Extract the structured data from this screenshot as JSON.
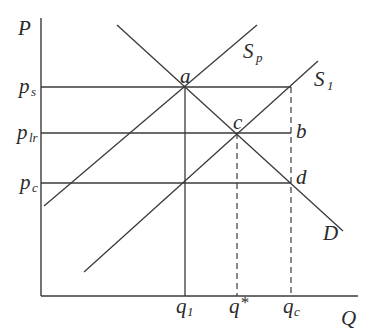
{
  "diagram": {
    "type": "supply-demand",
    "axes": {
      "y_label": "P",
      "x_label": "Q"
    },
    "price_levels": [
      {
        "id": "ps",
        "base": "p",
        "sub": "s",
        "y": 87
      },
      {
        "id": "plr",
        "base": "p",
        "sub": "lr",
        "y": 133
      },
      {
        "id": "pc",
        "base": "p",
        "sub": "c",
        "y": 183
      }
    ],
    "quantity_levels": [
      {
        "id": "q1",
        "base": "q",
        "sub": "1",
        "x": 185,
        "style": "solid"
      },
      {
        "id": "qstar",
        "base": "q",
        "sup": "*",
        "x": 237,
        "style": "dashed"
      },
      {
        "id": "qc",
        "base": "q",
        "sub": "c",
        "x": 291,
        "style": "dashed"
      }
    ],
    "curves": [
      {
        "id": "D",
        "label": "D",
        "from": [
          117,
          25
        ],
        "to": [
          343,
          231
        ]
      },
      {
        "id": "Sp",
        "label": "S",
        "sub": "p",
        "from": [
          44,
          206
        ],
        "to": [
          257,
          25
        ]
      },
      {
        "id": "S1",
        "label": "S",
        "sub": "1",
        "from": [
          84,
          272
        ],
        "to": [
          318,
          61
        ]
      }
    ],
    "points": [
      {
        "id": "a",
        "label": "a",
        "x": 185,
        "y": 87
      },
      {
        "id": "b",
        "label": "b",
        "x": 291,
        "y": 133
      },
      {
        "id": "c",
        "label": "c",
        "x": 237,
        "y": 133
      },
      {
        "id": "d",
        "label": "d",
        "x": 291,
        "y": 183
      }
    ]
  },
  "labels": {
    "P": "P",
    "Q": "Q",
    "p": "p",
    "q": "q",
    "s": "s",
    "lr": "lr",
    "c": "c",
    "one": "1",
    "star": "*",
    "S": "S",
    "sub_p": "p",
    "D": "D",
    "a": "a",
    "b": "b",
    "c_pt": "c",
    "d": "d"
  }
}
